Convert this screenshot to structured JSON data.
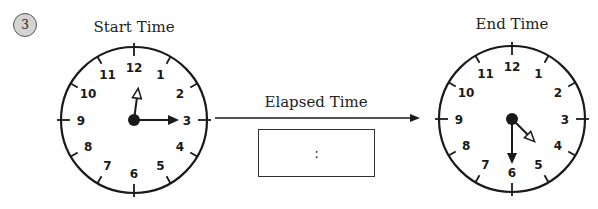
{
  "problem": {
    "number": "3"
  },
  "start_clock": {
    "title": "Start Time",
    "numerals": [
      "12",
      "1",
      "2",
      "3",
      "4",
      "5",
      "6",
      "7",
      "8",
      "9",
      "10",
      "11"
    ],
    "hour_hand_angle_deg": 7.5,
    "minute_hand_angle_deg": 90,
    "shown_time": "12:15"
  },
  "end_clock": {
    "title": "End Time",
    "numerals": [
      "12",
      "1",
      "2",
      "3",
      "4",
      "5",
      "6",
      "7",
      "8",
      "9",
      "10",
      "11"
    ],
    "hour_hand_angle_deg": 135,
    "minute_hand_angle_deg": 180,
    "shown_time": "4:30"
  },
  "elapsed": {
    "label": "Elapsed Time",
    "answer_placeholder": ":"
  },
  "colors": {
    "ink": "#1a1a1a",
    "badge_fill": "#d3d3d3"
  }
}
